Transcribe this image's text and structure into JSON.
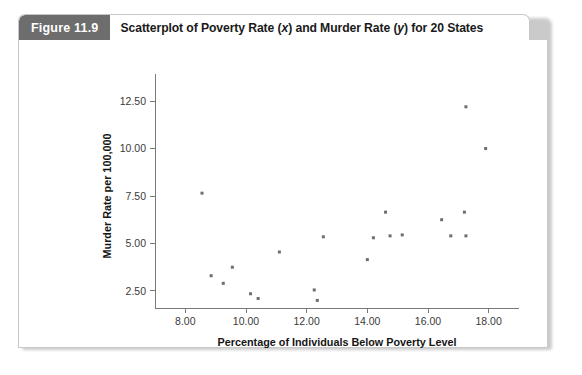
{
  "figure": {
    "label": "Figure 11.9",
    "title_prefix": "Scatterplot of Poverty Rate (",
    "title_x_var": "x",
    "title_mid": ") and Murder Rate (",
    "title_y_var": "y",
    "title_suffix": ") for 20 States",
    "title_full": "Scatterplot of Poverty Rate (x) and Murder Rate (y) for 20 States"
  },
  "colors": {
    "label_background": "#6d6d6d",
    "label_text": "#ffffff",
    "panel_border": "#c8c8c8",
    "axis": "#7a7a7a",
    "point": "#6e6e72",
    "page_background": "#ffffff"
  },
  "chart_data": {
    "type": "scatter",
    "title": "Scatterplot of Poverty Rate (x) and Murder Rate (y) for 20 States",
    "xlabel": "Percentage of Individuals Below Poverty Level",
    "ylabel": "Murder Rate per 100,000",
    "xlim": [
      7.0,
      19.0
    ],
    "ylim": [
      1.6,
      13.4
    ],
    "xticks": [
      8.0,
      10.0,
      12.0,
      14.0,
      16.0,
      18.0
    ],
    "xtick_labels": [
      "8.00",
      "10.00",
      "12.00",
      "14.00",
      "16.00",
      "18.00"
    ],
    "yticks": [
      2.5,
      5.0,
      7.5,
      10.0,
      12.5
    ],
    "ytick_labels": [
      "2.50",
      "5.00",
      "7.50",
      "10.00",
      "12.50"
    ],
    "grid": false,
    "legend": false,
    "n_points": 20,
    "marker": "square",
    "marker_size": 3,
    "points": [
      {
        "x": 8.55,
        "y": 7.65
      },
      {
        "x": 8.85,
        "y": 3.3
      },
      {
        "x": 9.25,
        "y": 2.9
      },
      {
        "x": 9.55,
        "y": 3.75
      },
      {
        "x": 10.15,
        "y": 2.35
      },
      {
        "x": 10.4,
        "y": 2.1
      },
      {
        "x": 11.1,
        "y": 4.55
      },
      {
        "x": 12.25,
        "y": 2.55
      },
      {
        "x": 12.35,
        "y": 2.0
      },
      {
        "x": 12.55,
        "y": 5.35
      },
      {
        "x": 14.0,
        "y": 4.15
      },
      {
        "x": 14.2,
        "y": 5.3
      },
      {
        "x": 14.6,
        "y": 6.65
      },
      {
        "x": 14.75,
        "y": 5.4
      },
      {
        "x": 15.15,
        "y": 5.45
      },
      {
        "x": 16.45,
        "y": 6.25
      },
      {
        "x": 16.75,
        "y": 5.4
      },
      {
        "x": 17.2,
        "y": 6.65
      },
      {
        "x": 17.25,
        "y": 5.4
      },
      {
        "x": 17.25,
        "y": 12.2
      },
      {
        "x": 17.9,
        "y": 10.0
      }
    ]
  }
}
